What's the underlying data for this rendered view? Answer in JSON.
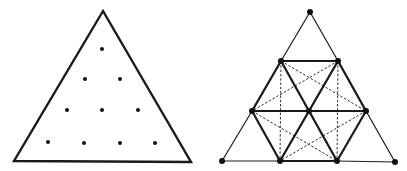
{
  "figure": {
    "width": 407,
    "height": 171,
    "stroke_color": "#1a1a1a",
    "dot_color": "#111111"
  },
  "left_triangle": {
    "outline": [
      [
        103,
        11
      ],
      [
        14,
        161
      ],
      [
        191,
        162
      ]
    ],
    "dots": [
      [
        102,
        49
      ],
      [
        85,
        79
      ],
      [
        120,
        79
      ],
      [
        67,
        110
      ],
      [
        102,
        110
      ],
      [
        138,
        110
      ],
      [
        48,
        142
      ],
      [
        84,
        143
      ],
      [
        120,
        143
      ],
      [
        155,
        143
      ]
    ]
  },
  "right_triangle": {
    "points": {
      "A": [
        310,
        12
      ],
      "B": [
        281,
        61
      ],
      "C": [
        338,
        61
      ],
      "D": [
        252,
        111
      ],
      "E": [
        309,
        111
      ],
      "F": [
        366,
        111
      ],
      "G": [
        222,
        161
      ],
      "H": [
        280,
        161
      ],
      "I": [
        337,
        161
      ],
      "J": [
        395,
        162
      ]
    },
    "thin_edges": [
      [
        "A",
        "B"
      ],
      [
        "A",
        "C"
      ],
      [
        "B",
        "D"
      ],
      [
        "C",
        "F"
      ],
      [
        "D",
        "G"
      ],
      [
        "F",
        "J"
      ],
      [
        "G",
        "H"
      ],
      [
        "I",
        "J"
      ],
      [
        "B",
        "E"
      ],
      [
        "C",
        "E"
      ],
      [
        "E",
        "H"
      ],
      [
        "E",
        "I"
      ],
      [
        "D",
        "E"
      ],
      [
        "E",
        "F"
      ]
    ],
    "thick_edges": [
      [
        "B",
        "C"
      ],
      [
        "B",
        "D"
      ],
      [
        "C",
        "F"
      ],
      [
        "D",
        "H"
      ],
      [
        "F",
        "I"
      ],
      [
        "H",
        "I"
      ],
      [
        "D",
        "F"
      ],
      [
        "B",
        "I"
      ],
      [
        "C",
        "H"
      ]
    ],
    "dashed_edges": [
      [
        "B",
        "H"
      ],
      [
        "C",
        "I"
      ],
      [
        "B",
        "F"
      ],
      [
        "C",
        "D"
      ],
      [
        "D",
        "I"
      ],
      [
        "F",
        "H"
      ]
    ]
  }
}
